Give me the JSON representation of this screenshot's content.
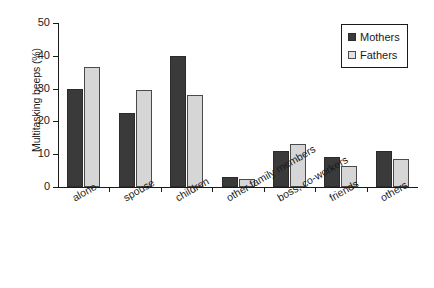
{
  "chart_data": {
    "type": "bar",
    "title": "",
    "xlabel": "",
    "ylabel": "Multitasking beeps (%)",
    "ylim": [
      0,
      50
    ],
    "yticks": [
      0,
      10,
      20,
      30,
      40,
      50
    ],
    "grid": false,
    "legend_position": "top-right",
    "categories": [
      "alone",
      "spouse",
      "children",
      "other family members",
      "boss, co-workers",
      "friends",
      "others"
    ],
    "series": [
      {
        "name": "Mothers",
        "color": "#3a3a3a",
        "values": [
          30,
          22.5,
          40,
          3,
          11,
          9,
          11
        ]
      },
      {
        "name": "Fathers",
        "color": "#d6d6d6",
        "values": [
          36.5,
          29.5,
          28,
          2.5,
          13,
          6.5,
          8.5
        ]
      }
    ]
  }
}
